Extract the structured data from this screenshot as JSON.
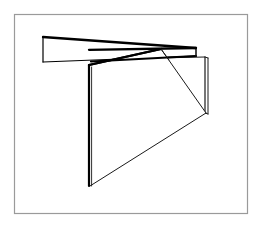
{
  "image": {
    "kind": "line-drawing",
    "subject": "three-intersecting-planes",
    "description": "Black-and-white wireframe line drawing of three flat rectangular panels intersecting in 3D space, enclosed by a thin grey rectangular border.",
    "canvas": {
      "width": 260,
      "height": 228
    },
    "background_color": "#ffffff"
  },
  "frame": {
    "name": "outer-border",
    "x": 14.5,
    "y": 14.5,
    "width": 233,
    "height": 199,
    "stroke_color": "#9a9a9a",
    "stroke_width": 1.2
  },
  "style": {
    "ink_color": "#000000",
    "thin_ink_color": "#1a1a1a",
    "face_fill": "#ffffff",
    "heavy_stroke_width": 2.2,
    "medium_stroke_width": 1.5,
    "thin_stroke_width": 1.0
  },
  "panels": [
    {
      "id": "horizontal-slab",
      "label": "Horizontal panel (upper-left wing)",
      "outline": "43,37 196,48 196,56 43,62",
      "top_edge": "43,37 196,48",
      "bottom_edge": "43,62 196,56",
      "left_edge": "43,37 43,62",
      "right_edge": "196,48 196,56",
      "inner_fold": "43,62 165,52"
    },
    {
      "id": "right-vertical-panel",
      "label": "Right vertical panel",
      "outline": "157,58 205,57 205,113 157,97",
      "left_edge": "157,58 157,97",
      "top_edge": "157,58 205,57",
      "right_edge": "205,57 205,113",
      "bottom_edge": "157,97 205,113",
      "thickness_edge": "207,58 207,114",
      "thickness_top": "205,57 207,58",
      "thickness_bottom": "205,113 207,114"
    },
    {
      "id": "center-vertical-panel",
      "label": "Central vertical panel (foreground)",
      "outline": "89,65 161,49 206,113 89,186",
      "left_edge": "89,65 89,186",
      "top_edge": "89,65 161,49",
      "far_edge": "161,49 206,113",
      "bottom_edge": "89,186 206,113",
      "thickness_edge": "91,66 91,187"
    }
  ],
  "intersection": {
    "name": "crossing-point",
    "x": 158,
    "y": 51,
    "note": "Horizontal slab passes through the central vertical panel near its top edge."
  }
}
